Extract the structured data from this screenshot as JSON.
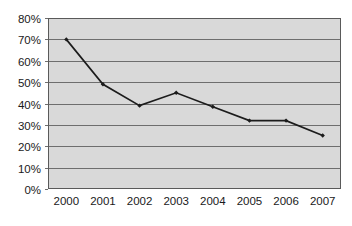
{
  "chart_data": {
    "type": "line",
    "title": "",
    "subtitle": "",
    "xlabel": "",
    "ylabel": "",
    "categories": [
      "2000",
      "2001",
      "2002",
      "2003",
      "2004",
      "2005",
      "2006",
      "2007"
    ],
    "values": [
      70,
      49,
      39,
      45,
      38.5,
      32,
      32,
      25
    ],
    "series": [
      {
        "name": "",
        "values": [
          70,
          49,
          39,
          45,
          38.5,
          32,
          32,
          25
        ]
      }
    ],
    "ylim": [
      0,
      80
    ],
    "ytick_step": 10,
    "ytick_labels": [
      "0%",
      "10%",
      "20%",
      "30%",
      "40%",
      "50%",
      "60%",
      "70%",
      "80%"
    ],
    "ytick_values": [
      0,
      10,
      20,
      30,
      40,
      50,
      60,
      70,
      80
    ],
    "xtick_labels": [
      "2000",
      "2001",
      "2002",
      "2003",
      "2004",
      "2005",
      "2006",
      "2007"
    ],
    "grid": "horizontal",
    "legend": "none",
    "value_suffix": "%",
    "marker": "diamond",
    "colors": {
      "plot_background": "#d9d9d9",
      "page_background": "#ffffff",
      "gridline": "#6e6e6e",
      "frame": "#5a5a5a",
      "series_line": "#1c1c1c",
      "marker": "#1c1c1c",
      "tick_label": "#1a1a1a"
    }
  },
  "layout": {
    "plot": {
      "left": 48,
      "top": 18,
      "right": 341,
      "bottom": 189
    },
    "width": 352,
    "height": 226
  }
}
